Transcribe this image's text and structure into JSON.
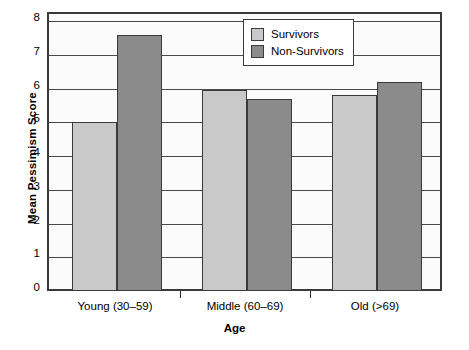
{
  "chart_data": {
    "type": "bar",
    "title": "",
    "xlabel": "Age",
    "ylabel": "Mean Pessimism Score",
    "categories": [
      "Young (30–59)",
      "Middle (60–69)",
      "Old (>69)"
    ],
    "series": [
      {
        "name": "Survivors",
        "color": "#c9c9c9",
        "values": [
          5.0,
          5.95,
          5.8
        ]
      },
      {
        "name": "Non-Survivors",
        "color": "#8b8b8b",
        "values": [
          7.6,
          5.7,
          6.2
        ]
      }
    ],
    "ylim": [
      0,
      8
    ],
    "yticks": [
      0,
      1,
      2,
      3,
      4,
      5,
      6,
      7,
      8
    ],
    "ytick_labels": [
      "0",
      "1",
      "2",
      "3",
      "4",
      "5",
      "6",
      "7",
      "8"
    ],
    "grid": true,
    "legend_position": "top-right"
  },
  "legend": {
    "items": [
      {
        "label": "Survivors"
      },
      {
        "label": "Non-Survivors"
      }
    ]
  }
}
